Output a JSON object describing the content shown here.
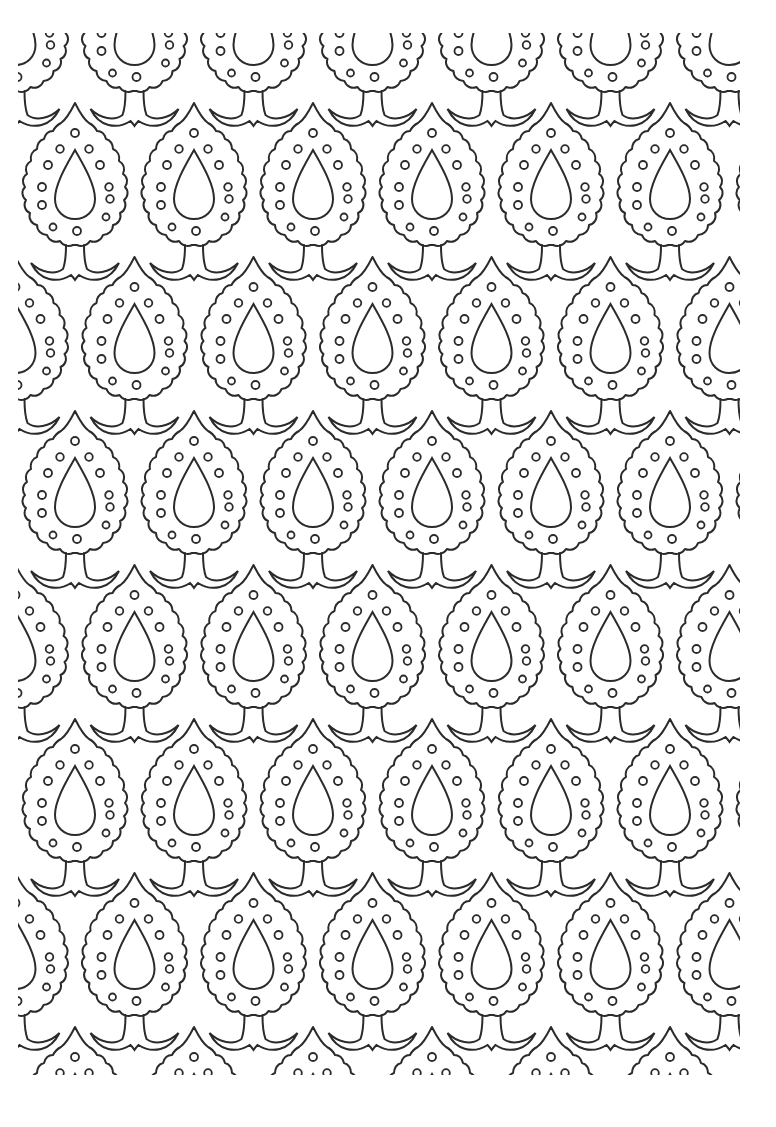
{
  "page": {
    "title": "Paisley teardrop coloring page",
    "background": "#ffffff",
    "line_color": "#2b2b2b"
  },
  "pattern": {
    "motif": "paisley-teardrop-tree",
    "pitch_x": 119,
    "pitch_y": 154,
    "row_offset_x": 59.5,
    "first_row_center": [
      75,
      185
    ],
    "rows": 8,
    "cols": 7,
    "dots_per_motif": 13
  }
}
